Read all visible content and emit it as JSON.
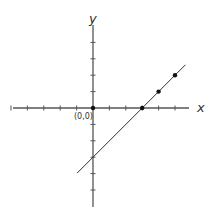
{
  "chart_data": {
    "type": "line",
    "title": "",
    "xlabel": "x",
    "ylabel": "y",
    "origin_label": "(0,0)",
    "xlim": [
      -5,
      5
    ],
    "ylim": [
      -6,
      5
    ],
    "grid": false,
    "x_ticks": [
      -5,
      -4,
      -3,
      -2,
      -1,
      1,
      2,
      3,
      4,
      5
    ],
    "y_ticks": [
      -5,
      -4,
      -3,
      -2,
      -1,
      1,
      2,
      3,
      4
    ],
    "series": [
      {
        "name": "y = x - 3",
        "line": {
          "x": [
            -1,
            6
          ],
          "y": [
            -4,
            3
          ]
        },
        "points": [
          {
            "x": 3,
            "y": 0
          },
          {
            "x": 4,
            "y": 1
          },
          {
            "x": 5,
            "y": 2
          }
        ]
      }
    ],
    "highlighted_points": [
      {
        "x": 0,
        "y": 0,
        "label": "(0,0)"
      }
    ],
    "colors": {
      "axis": "#555555",
      "line": "#333333",
      "point": "#111111"
    }
  }
}
